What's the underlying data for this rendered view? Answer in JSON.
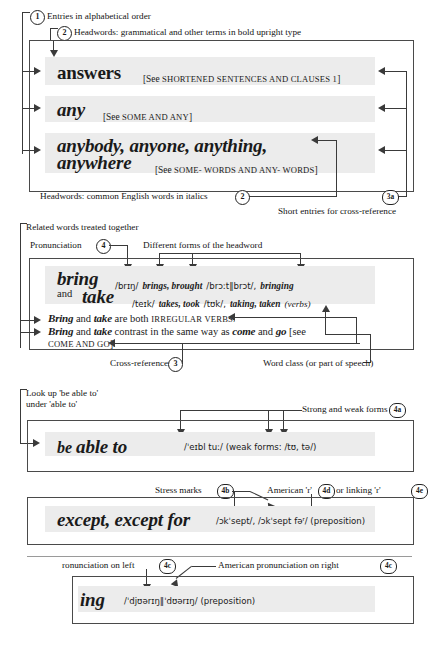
{
  "callouts": {
    "c1": "1",
    "c2": "2",
    "c2b": "2",
    "c3": "3",
    "c3a": "3a",
    "c4": "4",
    "c4a": "4a",
    "c4b": "4b",
    "c4c_left": "4c",
    "c4c_right": "4c",
    "c4d": "4d",
    "c4e": "4e"
  },
  "labels": {
    "entries_alpha": "Entries in alphabetical order",
    "headwords_bold": "Headwords: grammatical and other terms in bold upright type",
    "headwords_italic": "Headwords: common English words in italics",
    "short_entries": "Short entries for cross-reference",
    "related_words": "Related words treated together",
    "pronunciation": "Pronunciation",
    "different_forms": "Different forms of the headword",
    "cross_references": "Cross-references",
    "word_class": "Word class (or part of speech)",
    "look_up_line1": "Look up 'be able to'",
    "look_up_line2": "under 'able to'",
    "strong_weak": "Strong and weak forms",
    "stress_marks": "Stress marks",
    "american_r": "American 'r'",
    "or_linking_r": "or linking 'r'",
    "pron_left": "ronunciation on left",
    "pron_right": "American pronunciation on right"
  },
  "entries": {
    "answers": {
      "headword": "answers",
      "see_open": "[See ",
      "see_ref": "SHORTENED SENTENCES AND CLAUSES 1",
      "see_close": "]"
    },
    "any": {
      "headword": "any",
      "see_open": "[See ",
      "see_ref": "SOME AND ANY",
      "see_close": "]"
    },
    "anybody": {
      "headword_line1": "anybody, anyone, anything,",
      "headword_line2": "anywhere",
      "see_open": "[See ",
      "see_ref": "SOME- WORDS AND ANY- WORDS",
      "see_close": "]"
    },
    "bring_take": {
      "headword1": "bring",
      "pron1": "/brɪŋ/",
      "forms1a": "brings, brought",
      "pron1b": "/brɔːt‖brɔt/,",
      "forms1c": "bringing",
      "and": "and",
      "headword2": "take",
      "pron2": "/teɪk/",
      "forms2a": "takes, took",
      "pron2b": "/tʊk/,",
      "forms2c": "taking, taken",
      "wordclass": "(verbs)",
      "note1_a": "Bring",
      "note1_b": " and ",
      "note1_c": "take",
      "note1_d": " are both ",
      "note1_sc": "IRREGULAR VERBS.",
      "note2_a": "Bring",
      "note2_b": " and ",
      "note2_c": "take",
      "note2_d": " contrast in the same way as ",
      "note2_e": "come",
      "note2_f": " and ",
      "note2_g": "go",
      "note2_h": " [see",
      "note2_sc": "COME AND GO",
      "note2_end": "]."
    },
    "be_able_to": {
      "headword_a": "be ",
      "headword_b": "able to",
      "pron": "/ˈeɪbl tuː/ (weak forms: /tʊ, tə/)"
    },
    "except": {
      "headword": "except, except for",
      "pron": "/ɔkˈsept/, /ɔkˈsept fəʳ/ (preposition)"
    },
    "during": {
      "headword": "ing",
      "pron": "/ˈdjʊərɪŋ‖ˈdʊərɪŋ/ (preposition)"
    }
  },
  "colors": {
    "entry_background": "#ececec",
    "line": "#3a3a3a",
    "box_border": "#4a4a4a",
    "text": "#1a1a1a"
  }
}
